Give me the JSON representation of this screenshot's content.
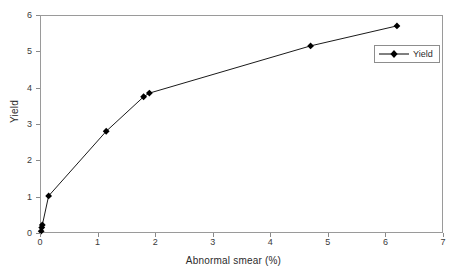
{
  "chart_data": {
    "type": "line",
    "title": "",
    "xlabel": "Abnormal smear (%)",
    "ylabel": "Yield",
    "xlim": [
      0,
      7
    ],
    "ylim": [
      0,
      6
    ],
    "xticks": [
      0,
      1,
      2,
      3,
      4,
      5,
      6,
      7
    ],
    "yticks": [
      0,
      1,
      2,
      3,
      4,
      5,
      6
    ],
    "grid": false,
    "legend": {
      "position": "upper-right-inside",
      "entries": [
        {
          "name": "Yield",
          "marker": "filled-diamond",
          "color": "#000000"
        }
      ]
    },
    "series": [
      {
        "name": "Yield",
        "marker": "filled-diamond",
        "color": "#000000",
        "points": [
          {
            "x": 0.02,
            "y": 0.05
          },
          {
            "x": 0.03,
            "y": 0.15
          },
          {
            "x": 0.04,
            "y": 0.22
          },
          {
            "x": 0.15,
            "y": 1.02
          },
          {
            "x": 1.15,
            "y": 2.8
          },
          {
            "x": 1.8,
            "y": 3.75
          },
          {
            "x": 1.9,
            "y": 3.85
          },
          {
            "x": 4.7,
            "y": 5.15
          },
          {
            "x": 6.2,
            "y": 5.7
          }
        ]
      }
    ]
  },
  "style": {
    "line_color": "#000000",
    "marker_color": "#000000",
    "frame_color": "#9a9a9a",
    "tick_color": "#8a8a8a",
    "text_color": "#2b2b2b",
    "background": "#ffffff"
  }
}
